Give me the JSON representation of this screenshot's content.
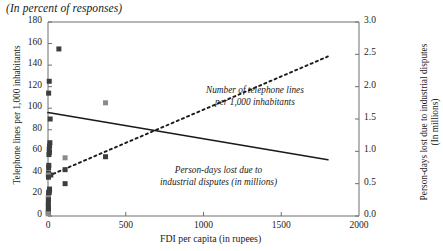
{
  "figure": {
    "title": "(In percent of responses)"
  },
  "axes": {
    "x": {
      "label": "FDI per capita (in rupees)",
      "min": 0,
      "max": 2000,
      "ticks": [
        "0",
        "500",
        "1000",
        "1500",
        "2000"
      ],
      "tick_values": [
        0,
        500,
        1000,
        1500,
        2000
      ]
    },
    "y_left": {
      "label": "Telephone lines per 1,000 inhabitants",
      "min": 0,
      "max": 180,
      "ticks": [
        "0",
        "20",
        "40",
        "60",
        "80",
        "100",
        "120",
        "140",
        "160",
        "180"
      ],
      "tick_values": [
        0,
        20,
        40,
        60,
        80,
        100,
        120,
        140,
        160,
        180
      ]
    },
    "y_right": {
      "label_line1": "Person-days lost due to industrial disputes",
      "label_line2": "(In millions)",
      "min": 0,
      "max": 3.0,
      "ticks": [
        "0.0",
        "0.5",
        "1.0",
        "1.5",
        "2.0",
        "2.5",
        "3.0"
      ],
      "tick_values": [
        0,
        0.5,
        1.0,
        1.5,
        2.0,
        2.5,
        3.0
      ]
    }
  },
  "annotations": {
    "dashed_line1": "Number of telephone lines",
    "dashed_line2": "per 1,000 inhabitants",
    "solid_line1": "Person-days lost due to",
    "solid_line2": "industrial disputes (in millions)"
  },
  "colors": {
    "marker": "#3d3d3d",
    "marker_light": "#8a8a8a",
    "line": "#1a1a1a",
    "axis": "#6e6e6e",
    "background": "#ffffff"
  },
  "chart_data": {
    "type": "scatter",
    "title": "(In percent of responses)",
    "xlabel": "FDI per capita (in rupees)",
    "ylabel": "Telephone lines per 1,000 inhabitants",
    "ylabel_right": "Person-days lost due to industrial disputes (In millions)",
    "xlim": [
      0,
      2000
    ],
    "ylim": [
      0,
      180
    ],
    "ylim_right": [
      0,
      3.0
    ],
    "grid": false,
    "legend": "annotations-inline",
    "series": [
      {
        "name": "Telephone lines per 1,000 inhabitants",
        "type": "scatter",
        "axis": "left",
        "marker": "square",
        "points": [
          [
            70,
            155
          ],
          [
            8,
            125
          ],
          [
            4,
            114
          ],
          [
            370,
            105
          ],
          [
            14,
            90
          ],
          [
            12,
            68
          ],
          [
            10,
            65
          ],
          [
            8,
            62
          ],
          [
            9,
            59
          ],
          [
            6,
            57
          ],
          [
            110,
            54
          ],
          [
            370,
            55
          ],
          [
            110,
            43
          ],
          [
            5,
            47
          ],
          [
            4,
            45
          ],
          [
            3,
            40
          ],
          [
            18,
            38
          ],
          [
            2,
            38
          ],
          [
            3,
            36
          ],
          [
            110,
            30
          ],
          [
            10,
            25
          ],
          [
            9,
            23
          ],
          [
            4,
            22
          ],
          [
            3,
            19
          ],
          [
            2,
            17
          ],
          [
            3,
            15
          ],
          [
            2,
            12
          ],
          [
            2,
            9
          ],
          [
            3,
            7
          ],
          [
            2,
            5
          ],
          [
            2,
            3
          ],
          [
            1,
            2
          ]
        ]
      },
      {
        "name": "Number of telephone lines per 1,000 inhabitants (trend)",
        "type": "line",
        "style": "dashed",
        "axis": "left",
        "x": [
          0,
          1800
        ],
        "y": [
          37,
          148
        ]
      },
      {
        "name": "Person-days lost due to industrial disputes (trend)",
        "type": "line",
        "style": "solid",
        "axis": "right",
        "x": [
          0,
          1800
        ],
        "y_left_equiv": [
          96,
          52
        ],
        "y": [
          1.6,
          0.87
        ]
      }
    ]
  }
}
